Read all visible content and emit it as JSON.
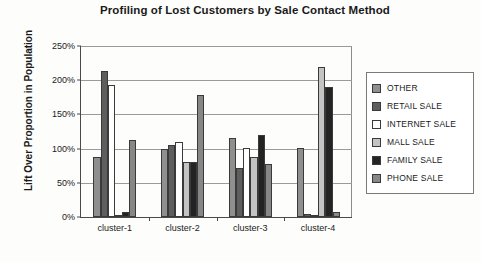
{
  "chart_data": {
    "type": "bar",
    "title": "Profiling of Lost Customers by Sale Contact Method",
    "xlabel": "",
    "ylabel": "Lift Over Proportion in Population",
    "categories": [
      "cluster-1",
      "cluster-2",
      "cluster-3",
      "cluster-4"
    ],
    "series": [
      {
        "name": "OTHER",
        "color": "#8f8f8f",
        "values": [
          88,
          100,
          115,
          101
        ]
      },
      {
        "name": "RETAIL SALE",
        "color": "#5e5e5e",
        "values": [
          213,
          105,
          72,
          5
        ]
      },
      {
        "name": "INTERNET SALE",
        "color": "#ffffff",
        "values": [
          193,
          110,
          101,
          1
        ]
      },
      {
        "name": "MALL SALE",
        "color": "#c4c4c4",
        "values": [
          2,
          80,
          88,
          219
        ]
      },
      {
        "name": "FAMILY SALE",
        "color": "#232323",
        "values": [
          8,
          80,
          120,
          190
        ]
      },
      {
        "name": "PHONE SALE",
        "color": "#878787",
        "values": [
          112,
          178,
          78,
          8
        ]
      }
    ],
    "ylim": [
      0,
      250
    ],
    "yticks": [
      "0%",
      "50%",
      "100%",
      "150%",
      "200%",
      "250%"
    ],
    "ytick_values": [
      0,
      50,
      100,
      150,
      200,
      250
    ],
    "grid": true,
    "legend_position": "right"
  },
  "legend": {
    "items": [
      {
        "label": "OTHER"
      },
      {
        "label": "RETAIL SALE"
      },
      {
        "label": "INTERNET SALE"
      },
      {
        "label": "MALL SALE"
      },
      {
        "label": "FAMILY SALE"
      },
      {
        "label": "PHONE SALE"
      }
    ]
  }
}
